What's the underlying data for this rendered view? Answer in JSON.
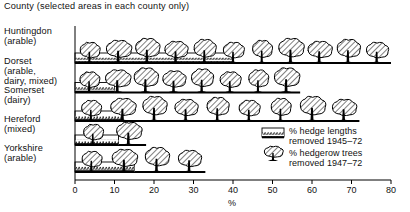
{
  "title": "County (selected areas in each county only)",
  "axis": {
    "label": "%",
    "min": 0,
    "max": 80,
    "ticks": [
      0,
      10,
      20,
      30,
      40,
      50,
      60,
      70,
      80
    ],
    "tick_labels": [
      "0",
      "10",
      "20",
      "30",
      "40",
      "50",
      "60",
      "70",
      "80"
    ]
  },
  "legend": {
    "items": [
      {
        "swatch": "hedge-strip-swatch",
        "label": "% hedge lengths\nremoved 1945–72"
      },
      {
        "swatch": "tree-swatch",
        "label": "% hedgerow trees\nremoved 1947–72"
      }
    ]
  },
  "rows": [
    {
      "label": "Huntingdon\n(arable)",
      "hedge": 40,
      "trees": 80
    },
    {
      "label": "Dorset\n(arable,\ndairy, mixed)",
      "hedge": 10,
      "trees": 57
    },
    {
      "label": "Somerset\n(dairy)",
      "hedge": 12,
      "trees": 72
    },
    {
      "label": "Hereford\n(mixed)",
      "hedge": 11,
      "trees": 18
    },
    {
      "label": "Yorkshire\n(arable)",
      "hedge": 15,
      "trees": 33
    }
  ],
  "chart_data": {
    "type": "bar",
    "title": "County (selected areas in each county only)",
    "xlabel": "%",
    "ylabel": "County (selected areas in each county only)",
    "xlim": [
      0,
      80
    ],
    "grid": false,
    "legend_position": "lower-right",
    "orientation": "horizontal",
    "categories": [
      "Huntingdon (arable)",
      "Dorset (arable, dairy, mixed)",
      "Somerset (dairy)",
      "Hereford (mixed)",
      "Yorkshire (arable)"
    ],
    "series": [
      {
        "name": "% hedge lengths removed 1945–72",
        "values": [
          40,
          10,
          12,
          11,
          15
        ]
      },
      {
        "name": "% hedgerow trees removed 1947–72",
        "values": [
          80,
          57,
          72,
          18,
          33
        ]
      }
    ]
  }
}
